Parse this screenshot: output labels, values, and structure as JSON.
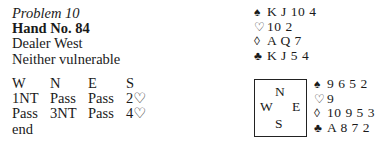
{
  "problem": {
    "title": "Problem 10",
    "hand_number": "Hand No. 84",
    "dealer": "Dealer West",
    "vulnerability": "Neither vulnerable"
  },
  "auction": {
    "headers": [
      "W",
      "N",
      "E",
      "S"
    ],
    "rows": [
      [
        "1NT",
        "Pass",
        "Pass",
        "2♡"
      ],
      [
        "Pass",
        "3NT",
        "Pass",
        "4♡"
      ],
      [
        "end",
        "",
        "",
        ""
      ]
    ]
  },
  "compass": {
    "north": "N",
    "west": "W",
    "east": "E",
    "south": "S"
  },
  "suit_symbols": {
    "spades": "♠",
    "hearts": "♡",
    "diamonds": "◊",
    "clubs": "♣"
  },
  "north_hand": {
    "spades": "K J 10 4",
    "hearts": "10 2",
    "diamonds": "A Q 7",
    "clubs": "K J 5 4"
  },
  "east_hand": {
    "spades": "9 6 5 2",
    "hearts": "9",
    "diamonds": "10 9 5 3",
    "clubs": "A 8 7 2"
  }
}
